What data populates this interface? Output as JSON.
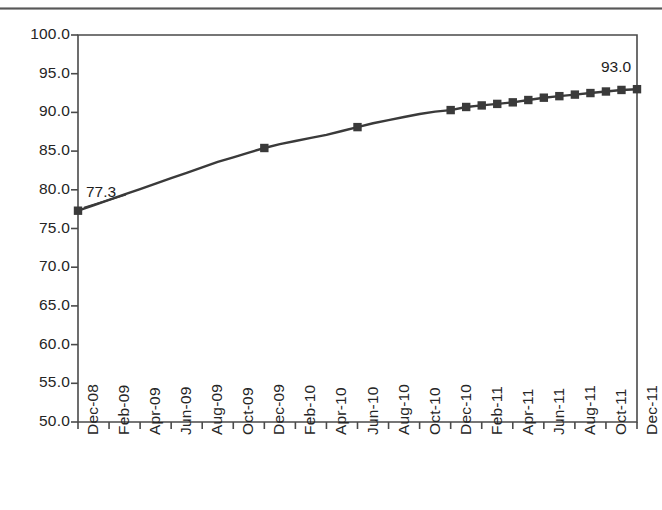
{
  "chart_data": {
    "type": "line",
    "title": "",
    "subtitle": "",
    "xlabel": "",
    "ylabel": "",
    "ylim": [
      50.0,
      100.0
    ],
    "ytick_step": 5.0,
    "ytick_labels": [
      "100.0",
      "95.0",
      "90.0",
      "85.0",
      "80.0",
      "75.0",
      "70.0",
      "65.0",
      "60.0",
      "55.0",
      "50.0"
    ],
    "ytick_values": [
      100.0,
      95.0,
      90.0,
      85.0,
      80.0,
      75.0,
      70.0,
      65.0,
      60.0,
      55.0,
      50.0
    ],
    "xtick_labels": [
      "Dec-08",
      "Feb-09",
      "Apr-09",
      "Jun-09",
      "Aug-09",
      "Oct-09",
      "Dec-09",
      "Feb-10",
      "Apr-10",
      "Jun-10",
      "Aug-10",
      "Oct-10",
      "Dec-10",
      "Feb-11",
      "Apr-11",
      "Jun-11",
      "Aug-11",
      "Oct-11",
      "Dec-11"
    ],
    "grid": false,
    "legend": "none",
    "line_color": "#3a3a3a",
    "marker_color": "#3a3a3a",
    "marker_shape": "square",
    "axis_color": "#4a4a4a",
    "categories": [
      "Dec-08",
      "Jan-09",
      "Feb-09",
      "Mar-09",
      "Apr-09",
      "May-09",
      "Jun-09",
      "Jul-09",
      "Aug-09",
      "Sep-09",
      "Oct-09",
      "Nov-09",
      "Dec-09",
      "Jan-10",
      "Feb-10",
      "Mar-10",
      "Apr-10",
      "May-10",
      "Jun-10",
      "Jul-10",
      "Aug-10",
      "Sep-10",
      "Oct-10",
      "Nov-10",
      "Dec-10",
      "Jan-11",
      "Feb-11",
      "Mar-11",
      "Apr-11",
      "May-11",
      "Jun-11",
      "Jul-11",
      "Aug-11",
      "Sep-11",
      "Oct-11",
      "Nov-11",
      "Dec-11"
    ],
    "values": [
      77.3,
      78.0,
      78.7,
      79.4,
      80.1,
      80.8,
      81.5,
      82.2,
      82.9,
      83.6,
      84.2,
      84.8,
      85.4,
      85.9,
      86.3,
      86.7,
      87.1,
      87.6,
      88.1,
      88.6,
      89.0,
      89.4,
      89.8,
      90.1,
      90.3,
      90.7,
      90.9,
      91.1,
      91.3,
      91.6,
      91.9,
      92.1,
      92.3,
      92.5,
      92.7,
      92.9,
      93.0
    ],
    "marker_categories": [
      "Dec-08",
      "Dec-09",
      "Jun-10",
      "Dec-10",
      "Jan-11",
      "Feb-11",
      "Mar-11",
      "Apr-11",
      "May-11",
      "Jun-11",
      "Jul-11",
      "Aug-11",
      "Sep-11",
      "Oct-11",
      "Nov-11",
      "Dec-11"
    ],
    "data_labels": [
      {
        "category": "Dec-08",
        "text": "77.3",
        "value": 77.3
      },
      {
        "category": "Dec-11",
        "text": "93.0",
        "value": 93.0
      }
    ]
  },
  "annotations": {
    "first_point_label": "77.3",
    "last_point_label": "93.0"
  }
}
